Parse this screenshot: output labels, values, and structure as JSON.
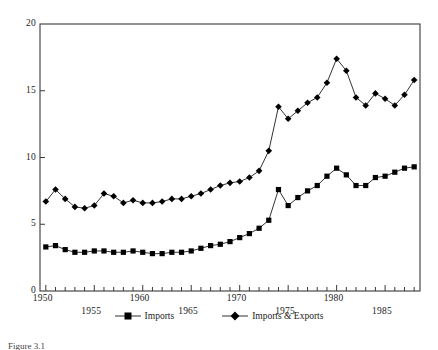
{
  "chart_data": {
    "type": "line",
    "title": "",
    "xlabel": "",
    "ylabel": "",
    "xlim": [
      1949.4,
      1988.6
    ],
    "ylim": [
      0,
      20
    ],
    "yticks": [
      0,
      5,
      10,
      15,
      20
    ],
    "xticks_major": [
      1950,
      1955,
      1960,
      1965,
      1970,
      1975,
      1980,
      1985
    ],
    "xtick_labels_row1": [
      "1950",
      "1960",
      "1970",
      "1980"
    ],
    "xtick_labels_row2": [
      "1955",
      "1965",
      "1975",
      "1985"
    ],
    "grid": false,
    "legend_position": "bottom",
    "x": [
      1950,
      1951,
      1952,
      1953,
      1954,
      1955,
      1956,
      1957,
      1958,
      1959,
      1960,
      1961,
      1962,
      1963,
      1964,
      1965,
      1966,
      1967,
      1968,
      1969,
      1970,
      1971,
      1972,
      1973,
      1974,
      1975,
      1976,
      1977,
      1978,
      1979,
      1980,
      1981,
      1982,
      1983,
      1984,
      1985,
      1986,
      1987,
      1988
    ],
    "series": [
      {
        "name": "Imports",
        "marker": "square",
        "color": "#000000",
        "values": [
          3.3,
          3.4,
          3.1,
          2.9,
          2.9,
          3.0,
          3.0,
          2.9,
          2.9,
          3.0,
          2.9,
          2.8,
          2.8,
          2.9,
          2.9,
          3.0,
          3.2,
          3.4,
          3.5,
          3.7,
          4.0,
          4.3,
          4.7,
          5.3,
          7.6,
          6.4,
          7.0,
          7.5,
          7.9,
          8.6,
          9.2,
          8.7,
          7.9,
          7.9,
          8.5,
          8.6,
          8.9,
          9.2,
          9.3
        ]
      },
      {
        "name": "Imports & Exports",
        "marker": "diamond",
        "color": "#000000",
        "values": [
          6.7,
          7.6,
          6.9,
          6.3,
          6.2,
          6.4,
          7.3,
          7.1,
          6.6,
          6.8,
          6.6,
          6.6,
          6.7,
          6.9,
          6.9,
          7.1,
          7.3,
          7.6,
          7.9,
          8.1,
          8.2,
          8.5,
          9.0,
          10.5,
          13.8,
          12.9,
          13.5,
          14.1,
          14.5,
          15.6,
          17.4,
          16.5,
          14.5,
          13.9,
          14.8,
          14.4,
          13.9,
          14.7,
          15.8
        ]
      }
    ]
  },
  "legend": {
    "entries": [
      {
        "label": "Imports"
      },
      {
        "label": "Imports & Exports"
      }
    ]
  },
  "caption": {
    "text": "Figure 3.1"
  }
}
